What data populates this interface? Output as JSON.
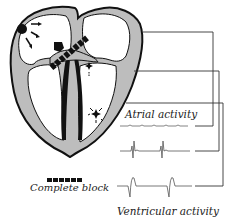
{
  "diagram": {
    "type": "cardiac conduction diagram",
    "labels": {
      "atrial_activity": "Atrial activity",
      "complete_block": "Complete block",
      "ventricular_activity": "Ventricular activity"
    },
    "legend": {
      "symbol": "dashed-black-bar",
      "meaning": "Complete block"
    },
    "elements": [
      {
        "name": "sa-node",
        "desc": "black dot in right atrium with radiating arrows"
      },
      {
        "name": "av-node",
        "desc": "black blob at top of septum"
      },
      {
        "name": "block-bar",
        "desc": "dashed black bar crossing AV junction"
      },
      {
        "name": "ectopic-focus-upper",
        "desc": "star near bundle branches"
      },
      {
        "name": "ectopic-focus-lower",
        "desc": "star in left ventricle wall"
      },
      {
        "name": "bundle-branches",
        "desc": "black bands down septum"
      }
    ],
    "traces": [
      {
        "name": "atrial-trace",
        "desc": "small regular P waves"
      },
      {
        "name": "ecg-trace",
        "desc": "dissociated QRS complexes"
      },
      {
        "name": "ventricular-trace",
        "desc": "slow wide ventricular complexes"
      }
    ],
    "colors": {
      "ink": "#111111",
      "wall": "#bdbdbd",
      "background": "#ffffff"
    }
  }
}
